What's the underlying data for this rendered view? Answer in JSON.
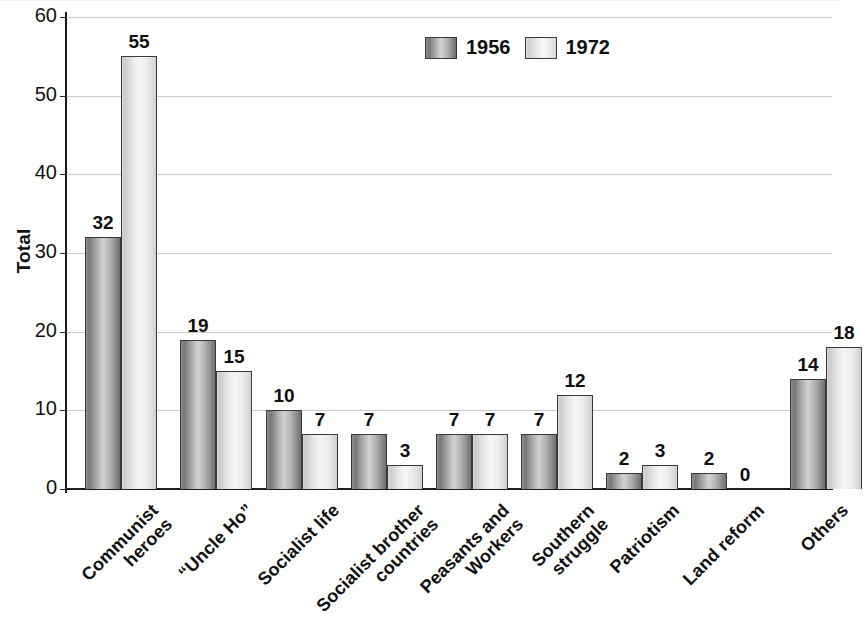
{
  "chart_data": {
    "type": "bar",
    "title": "",
    "xlabel": "",
    "ylabel": "Total",
    "ylim": [
      0,
      60
    ],
    "yticks": [
      0,
      10,
      20,
      30,
      40,
      50,
      60
    ],
    "grid": true,
    "legend_position": "top-center",
    "categories": [
      "Communist\nheroes",
      "“Uncle Ho”",
      "Socialist life",
      "Socialist brother\ncountries",
      "Peasants and\nWorkers",
      "Southern\nstruggle",
      "Patriotism",
      "Land reform",
      "Others"
    ],
    "series": [
      {
        "name": "1956",
        "values": [
          32,
          19,
          10,
          7,
          7,
          7,
          2,
          2,
          14
        ]
      },
      {
        "name": "1972",
        "values": [
          55,
          15,
          7,
          3,
          7,
          12,
          3,
          0,
          18
        ]
      }
    ],
    "colors": {
      "series_1956": "#9a9a9a",
      "series_1972": "#ededed",
      "gridline": "#c9c9c9",
      "axis": "#1c1c1c",
      "text": "#0f0f0f",
      "background": "#ffffff"
    }
  },
  "axis": {
    "y_title": "Total",
    "y_tick_labels": [
      "0",
      "10",
      "20",
      "30",
      "40",
      "50",
      "60"
    ]
  },
  "legend": {
    "items": [
      {
        "label": "1956",
        "swatch": "dark-gray-gradient-swatch"
      },
      {
        "label": "1972",
        "swatch": "light-gray-gradient-swatch"
      }
    ]
  },
  "bar_value_labels": {
    "s1956": [
      "32",
      "19",
      "10",
      "7",
      "7",
      "7",
      "2",
      "2",
      "14"
    ],
    "s1972": [
      "55",
      "15",
      "7",
      "3",
      "7",
      "12",
      "3",
      "0",
      "18"
    ]
  },
  "category_labels": [
    {
      "line1": "Communist",
      "line2": "heroes"
    },
    {
      "line1": "“Uncle Ho”",
      "line2": ""
    },
    {
      "line1": "Socialist life",
      "line2": ""
    },
    {
      "line1": "Socialist brother",
      "line2": "countries"
    },
    {
      "line1": "Peasants and",
      "line2": "Workers"
    },
    {
      "line1": "Southern",
      "line2": "struggle"
    },
    {
      "line1": "Patriotism",
      "line2": ""
    },
    {
      "line1": "Land reform",
      "line2": ""
    },
    {
      "line1": "Others",
      "line2": ""
    }
  ]
}
